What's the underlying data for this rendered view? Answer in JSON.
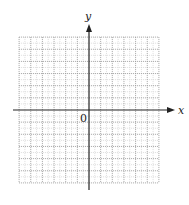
{
  "diagram": {
    "type": "coordinate-grid",
    "x_axis_label": "x",
    "y_axis_label": "y",
    "origin_label": "0",
    "grid": {
      "cells_left": 6,
      "cells_right": 6,
      "cells_up": 6,
      "cells_down": 6,
      "minor_subdivisions": 2,
      "major_line_style": "dotted",
      "major_color": "#9a9a9a",
      "minor_color": "#d6d6d6"
    },
    "axis_color": "#222222"
  }
}
